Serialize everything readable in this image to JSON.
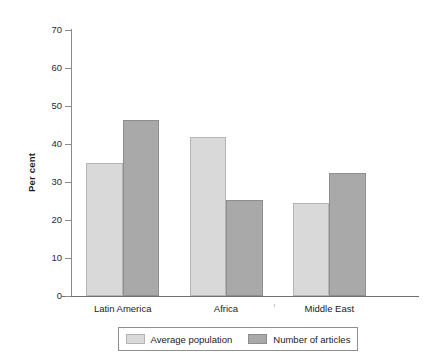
{
  "chart_data": {
    "type": "bar",
    "title": "",
    "xlabel": "",
    "ylabel": "Per cent",
    "categories": [
      "Latin America",
      "Africa",
      "Middle East"
    ],
    "series": [
      {
        "name": "Average population",
        "color": "#d9d9d9",
        "values": [
          35.0,
          41.8,
          24.5
        ]
      },
      {
        "name": "Number of articles",
        "color": "#a9a9a9",
        "values": [
          46.2,
          25.3,
          32.4
        ]
      }
    ],
    "ylim": [
      0,
      70
    ],
    "yticks": [
      0,
      10,
      20,
      30,
      40,
      50,
      60,
      70
    ],
    "ytick_labels": [
      "0",
      "10",
      "20",
      "30",
      "40",
      "50",
      "60",
      "70"
    ],
    "grid": false,
    "legend_position": "bottom"
  },
  "axis": {
    "y_label": "Per cent"
  },
  "legend": {
    "entries": [
      {
        "label": "Average population",
        "swatch": "light-grey-swatch"
      },
      {
        "label": "Number of articles",
        "swatch": "dark-grey-swatch"
      }
    ]
  }
}
